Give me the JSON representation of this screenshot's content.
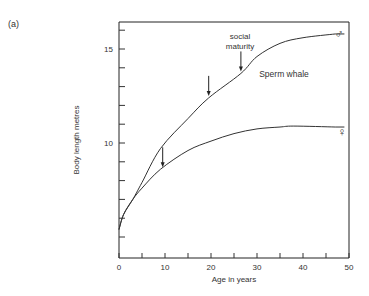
{
  "figure": {
    "panel_label": "(a)",
    "species_label": "Sperm whale",
    "annotation": [
      "social",
      "maturity"
    ],
    "male_symbol": "♂",
    "female_symbol": "♀"
  },
  "chart_data": {
    "type": "line",
    "title": "",
    "panel": "(a)",
    "xlabel": "Age in years",
    "ylabel": "Body length metres",
    "xlim": [
      0,
      50
    ],
    "ylim": [
      3.9,
      16.6
    ],
    "x_ticks": [
      0,
      10,
      20,
      30,
      40,
      50
    ],
    "x_minor_ticks": [
      5,
      15,
      25,
      35,
      45
    ],
    "y_ticks_labeled": [
      10,
      15
    ],
    "y_minor_ticks": [
      5,
      6,
      7,
      8,
      9,
      11,
      12,
      13,
      14,
      16
    ],
    "grid": false,
    "legend": "direct labels (♂ at end of upper curve, ♀ at end of lower curve)",
    "annotations": [
      {
        "text": "Sperm whale",
        "x": 38,
        "y": 13.3
      },
      {
        "text": "social maturity",
        "x": 26.5,
        "y": 15.2,
        "arrow_to": [
          26.5,
          13.7
        ]
      },
      {
        "text": "",
        "arrow_at": [
          19.5,
          12.4
        ]
      },
      {
        "text": "",
        "arrow_at": [
          9.5,
          8.6
        ]
      }
    ],
    "series": [
      {
        "name": "Male (♂)",
        "x": [
          0,
          1,
          3,
          5,
          9,
          15,
          19.5,
          26.5,
          30,
          35,
          40,
          47
        ],
        "y": [
          5.4,
          6.2,
          7.0,
          7.9,
          9.7,
          11.3,
          12.4,
          13.7,
          14.6,
          15.3,
          15.6,
          15.8
        ]
      },
      {
        "name": "Female (♀)",
        "x": [
          0,
          1,
          3,
          5,
          9,
          15,
          20,
          25,
          30,
          35,
          38,
          47
        ],
        "y": [
          5.4,
          6.2,
          7.0,
          7.6,
          8.6,
          9.6,
          10.1,
          10.5,
          10.75,
          10.85,
          10.9,
          10.85
        ]
      }
    ]
  }
}
